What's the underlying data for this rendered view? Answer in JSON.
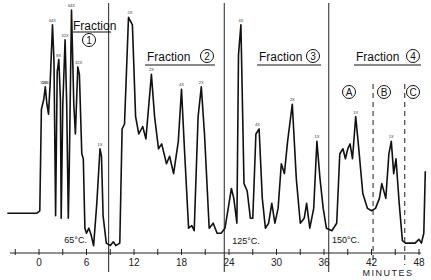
{
  "chart_data": {
    "type": "line",
    "title": "",
    "xlabel": "MINUTES",
    "ylabel": "",
    "xlim": [
      -4,
      49
    ],
    "ylim": [
      0,
      100
    ],
    "grid": false,
    "x_ticks": [
      0,
      6,
      12,
      18,
      24,
      30,
      36,
      42,
      48
    ],
    "x_minor_step": 3,
    "series": [
      {
        "name": "chromatogram",
        "points": [
          [
            -4,
            16
          ],
          [
            -0.3,
            16
          ],
          [
            0.1,
            17
          ],
          [
            0.3,
            58
          ],
          [
            0.6,
            62
          ],
          [
            0.8,
            67
          ],
          [
            1.0,
            60
          ],
          [
            1.2,
            56
          ],
          [
            1.4,
            68
          ],
          [
            1.7,
            92
          ],
          [
            1.9,
            77
          ],
          [
            2.1,
            15
          ],
          [
            2.3,
            73
          ],
          [
            2.5,
            78
          ],
          [
            2.7,
            62
          ],
          [
            2.8,
            14
          ],
          [
            3.0,
            60
          ],
          [
            3.3,
            86
          ],
          [
            3.5,
            60
          ],
          [
            3.7,
            14
          ],
          [
            3.8,
            30
          ],
          [
            4.1,
            98
          ],
          [
            4.4,
            60
          ],
          [
            4.6,
            48
          ],
          [
            4.9,
            75
          ],
          [
            5.1,
            72
          ],
          [
            5.4,
            40
          ],
          [
            5.6,
            38
          ],
          [
            5.8,
            10
          ],
          [
            6.0,
            8
          ],
          [
            6.3,
            10
          ],
          [
            6.6,
            7
          ],
          [
            6.9,
            3
          ],
          [
            7.3,
            20
          ],
          [
            7.7,
            42
          ],
          [
            7.9,
            39
          ],
          [
            8.1,
            15
          ],
          [
            8.5,
            4
          ],
          [
            9.0,
            3
          ],
          [
            9.4,
            4.5
          ],
          [
            9.7,
            3
          ],
          [
            10.2,
            4
          ],
          [
            10.5,
            50
          ],
          [
            10.8,
            52
          ],
          [
            11.3,
            95
          ],
          [
            11.8,
            92
          ],
          [
            12.2,
            55
          ],
          [
            12.6,
            48
          ],
          [
            13.1,
            51
          ],
          [
            13.5,
            46
          ],
          [
            14.2,
            72
          ],
          [
            14.6,
            55
          ],
          [
            15.1,
            42
          ],
          [
            15.5,
            44
          ],
          [
            16.1,
            36
          ],
          [
            16.5,
            39
          ],
          [
            17.0,
            32
          ],
          [
            17.6,
            45
          ],
          [
            18.0,
            66
          ],
          [
            18.4,
            40
          ],
          [
            18.9,
            10
          ],
          [
            19.3,
            11
          ],
          [
            19.6,
            9
          ],
          [
            20.1,
            55
          ],
          [
            20.5,
            67
          ],
          [
            20.9,
            48
          ],
          [
            21.5,
            10
          ],
          [
            22.0,
            12
          ],
          [
            22.5,
            8
          ],
          [
            23.0,
            8
          ],
          [
            23.5,
            10
          ],
          [
            24.0,
            20
          ],
          [
            24.3,
            26
          ],
          [
            24.6,
            22
          ],
          [
            25.0,
            12
          ],
          [
            25.2,
            80
          ],
          [
            25.5,
            92
          ],
          [
            25.9,
            28
          ],
          [
            26.3,
            25
          ],
          [
            26.7,
            14
          ],
          [
            27.0,
            14
          ],
          [
            27.4,
            48
          ],
          [
            27.8,
            50
          ],
          [
            28.2,
            22
          ],
          [
            28.6,
            10
          ],
          [
            29.0,
            12
          ],
          [
            29.4,
            20
          ],
          [
            29.8,
            12
          ],
          [
            30.2,
            18
          ],
          [
            30.6,
            36
          ],
          [
            31.0,
            32
          ],
          [
            31.4,
            45
          ],
          [
            32.0,
            60
          ],
          [
            32.5,
            30
          ],
          [
            33.0,
            12
          ],
          [
            33.5,
            14
          ],
          [
            33.8,
            20
          ],
          [
            34.2,
            10
          ],
          [
            34.7,
            18
          ],
          [
            35.1,
            45
          ],
          [
            35.5,
            30
          ],
          [
            35.9,
            18
          ],
          [
            36.3,
            10
          ],
          [
            37.0,
            9
          ],
          [
            37.6,
            12
          ],
          [
            38.0,
            40
          ],
          [
            38.4,
            42
          ],
          [
            38.7,
            38
          ],
          [
            39.0,
            42
          ],
          [
            39.3,
            44
          ],
          [
            39.6,
            38
          ],
          [
            40.0,
            55
          ],
          [
            40.4,
            42
          ],
          [
            40.9,
            24
          ],
          [
            41.5,
            18
          ],
          [
            42.0,
            17
          ],
          [
            42.5,
            18
          ],
          [
            43.0,
            22
          ],
          [
            43.3,
            28
          ],
          [
            43.8,
            22
          ],
          [
            44.2,
            40
          ],
          [
            44.5,
            45
          ],
          [
            44.8,
            32
          ],
          [
            45.1,
            38
          ],
          [
            45.5,
            20
          ],
          [
            45.9,
            5
          ],
          [
            46.3,
            4
          ],
          [
            46.9,
            4
          ],
          [
            47.5,
            4
          ],
          [
            48.0,
            5.5
          ],
          [
            48.3,
            4
          ],
          [
            48.6,
            8
          ],
          [
            48.8,
            33
          ]
        ]
      }
    ],
    "fraction_boundaries": [
      8.8,
      23.4,
      36.6
    ],
    "subfraction_boundaries": [
      42.2,
      46.2
    ],
    "fractions": [
      {
        "label": "Fraction",
        "number": "1"
      },
      {
        "label": "Fraction",
        "number": "2"
      },
      {
        "label": "Fraction",
        "number": "3"
      },
      {
        "label": "Fraction",
        "number": "4"
      }
    ],
    "subfractions": [
      "A",
      "B",
      "C"
    ],
    "temperature_annotations": [
      {
        "text": "65°C.",
        "x": 3.2
      },
      {
        "text": "125°C.",
        "x": 24.4
      },
      {
        "text": "150°C.",
        "x": 37.0
      }
    ],
    "peak_labels": [
      {
        "x": 0.6,
        "text": "32X"
      },
      {
        "x": 0.8,
        "text": "16X"
      },
      {
        "x": 1.7,
        "text": "64X"
      },
      {
        "x": 2.5,
        "text": "8X"
      },
      {
        "x": 3.3,
        "text": "32X"
      },
      {
        "x": 4.1,
        "text": "64X"
      },
      {
        "x": 5.0,
        "text": "32X"
      },
      {
        "x": 7.7,
        "text": "1X"
      },
      {
        "x": 11.5,
        "text": "2X"
      },
      {
        "x": 14.2,
        "text": "2X"
      },
      {
        "x": 18.0,
        "text": "4X"
      },
      {
        "x": 20.5,
        "text": "2X"
      },
      {
        "x": 25.5,
        "text": "4X"
      },
      {
        "x": 27.6,
        "text": "4X"
      },
      {
        "x": 32.0,
        "text": "2X"
      },
      {
        "x": 35.1,
        "text": "1X"
      },
      {
        "x": 40.0,
        "text": "1X"
      },
      {
        "x": 44.5,
        "text": "1X"
      }
    ]
  }
}
